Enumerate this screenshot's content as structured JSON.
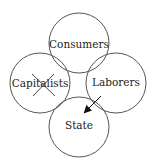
{
  "diagram": {
    "nodes": [
      {
        "id": "consumers",
        "label": "Consumers",
        "cx": 79,
        "cy": 43,
        "r": 30
      },
      {
        "id": "capitalists",
        "label": "Capitalists",
        "cx": 40,
        "cy": 83,
        "r": 30,
        "crossed_out": true
      },
      {
        "id": "laborers",
        "label": "Laborers",
        "cx": 116,
        "cy": 83,
        "r": 30
      },
      {
        "id": "state",
        "label": "State",
        "cx": 79,
        "cy": 127,
        "r": 30
      }
    ],
    "edges": [
      {
        "from": "laborers",
        "to": "state",
        "type": "arrow"
      }
    ],
    "colors": {
      "stroke": "#555555",
      "text": "#222222"
    }
  }
}
